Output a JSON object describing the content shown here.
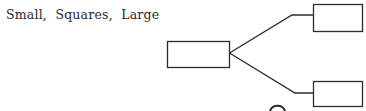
{
  "caption": "Small,  Squares,  Large",
  "diagram": {
    "type": "tree",
    "stroke_color": "#2b2b2b",
    "nodes": [
      {
        "id": "root",
        "label": "",
        "x": 167,
        "y": 41,
        "w": 62,
        "h": 26
      },
      {
        "id": "top-child",
        "label": "",
        "x": 313,
        "y": 4,
        "w": 49,
        "h": 27
      },
      {
        "id": "bottom-child",
        "label": "",
        "x": 313,
        "y": 81,
        "w": 49,
        "h": 25
      }
    ],
    "edges": [
      {
        "from": "root",
        "to": "top-child"
      },
      {
        "from": "root",
        "to": "bottom-child"
      }
    ]
  }
}
